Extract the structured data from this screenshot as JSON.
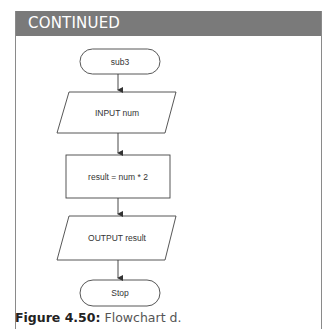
{
  "panel": {
    "header_title": "CONTINUED",
    "header_color": "#7a7a7a"
  },
  "flowchart": {
    "nodes": [
      {
        "id": "start",
        "type": "terminator",
        "label": "sub3"
      },
      {
        "id": "input",
        "type": "input-output",
        "label": "INPUT num"
      },
      {
        "id": "process",
        "type": "process",
        "label": "result = num * 2"
      },
      {
        "id": "output",
        "type": "input-output",
        "label": "OUTPUT result"
      },
      {
        "id": "stop",
        "type": "terminator",
        "label": "Stop"
      }
    ],
    "edges": [
      [
        "start",
        "input"
      ],
      [
        "input",
        "process"
      ],
      [
        "process",
        "output"
      ],
      [
        "output",
        "stop"
      ]
    ]
  },
  "caption": {
    "label": "Figure 4.50:",
    "text": "Flowchart d."
  }
}
